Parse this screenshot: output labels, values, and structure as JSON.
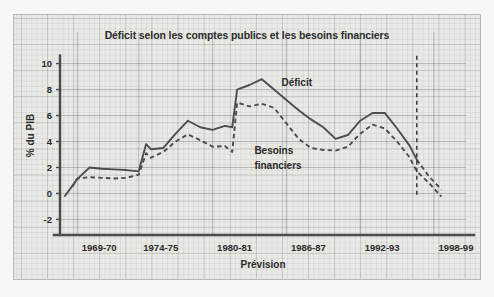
{
  "figure": {
    "background_color": "#f7f7f6",
    "panel_background_color": "#e9e9e6",
    "panel_border_color": "#b9b9b6",
    "line_color": "#4d4d4d"
  },
  "chart_data": {
    "type": "line",
    "title": "Déficit selon les comptes publics et les besoins financiers",
    "xlabel": "Prévision",
    "ylabel": "% du PIB",
    "ylim": [
      -3.2,
      11.2
    ],
    "yticks": [
      10,
      8,
      6,
      4,
      2,
      0,
      -2
    ],
    "ytick_labels": [
      "10",
      "8",
      "6",
      "4",
      "2",
      "0",
      "-2"
    ],
    "xtick_labels": [
      "1969-70",
      "1974-75",
      "1980-81",
      "1986-87",
      "1992-93",
      "1998-99"
    ],
    "xtick_values": [
      1969,
      1974,
      1980,
      1986,
      1992,
      1998
    ],
    "xlim": [
      1967.6,
      2000.6
    ],
    "grid": true,
    "legend": "inline-annotations",
    "annotations": [
      {
        "text": "Déficit",
        "x": 1985.6,
        "y": 8.3
      },
      {
        "text": "Besoins",
        "x": 1983.4,
        "y": 3.05
      },
      {
        "text": "financiers",
        "x": 1983.4,
        "y": 1.85
      }
    ],
    "forecast_marker": {
      "label": "Prévision",
      "x": 1996.6,
      "y_top": 10.6,
      "y_bottom": -0.1,
      "style": "dashed-vertical"
    },
    "series": [
      {
        "name": "Déficit",
        "style": "solid",
        "dashed_after_x": 1996.6,
        "x": [
          1968.0,
          1969.0,
          1970.0,
          1971.0,
          1972.0,
          1973.0,
          1974.0,
          1974.6,
          1975.0,
          1976.0,
          1977.0,
          1978.0,
          1979.0,
          1980.0,
          1981.0,
          1981.6,
          1982.0,
          1983.0,
          1984.0,
          1985.0,
          1986.0,
          1987.0,
          1988.0,
          1989.0,
          1990.0,
          1991.0,
          1992.0,
          1993.0,
          1994.0,
          1995.0,
          1996.0,
          1996.6,
          1997.6,
          1998.6
        ],
        "y": [
          -0.2,
          1.1,
          2.0,
          1.9,
          1.85,
          1.8,
          1.7,
          3.8,
          3.4,
          3.5,
          4.6,
          5.6,
          5.1,
          4.9,
          5.2,
          5.1,
          8.0,
          8.35,
          8.8,
          8.0,
          7.2,
          6.4,
          5.7,
          5.1,
          4.2,
          4.5,
          5.6,
          6.2,
          6.2,
          5.0,
          3.7,
          2.6,
          1.3,
          0.3
        ]
      },
      {
        "name": "Besoins financiers",
        "style": "dashed",
        "x": [
          1968.6,
          1969.0,
          1970.0,
          1971.0,
          1972.0,
          1973.0,
          1974.0,
          1974.6,
          1975.0,
          1976.0,
          1977.0,
          1978.0,
          1979.0,
          1980.0,
          1981.0,
          1981.6,
          1982.0,
          1983.0,
          1984.0,
          1985.0,
          1986.0,
          1987.0,
          1988.0,
          1989.0,
          1990.0,
          1991.0,
          1992.0,
          1993.0,
          1994.0,
          1995.0,
          1996.0,
          1996.6,
          1997.6,
          1998.6
        ],
        "y": [
          0.5,
          1.15,
          1.25,
          1.2,
          1.15,
          1.2,
          1.45,
          3.1,
          2.75,
          3.2,
          4.0,
          4.55,
          4.1,
          3.6,
          3.65,
          3.2,
          7.0,
          6.7,
          6.9,
          6.6,
          5.4,
          4.2,
          3.5,
          3.35,
          3.3,
          3.6,
          4.6,
          5.3,
          5.0,
          4.0,
          2.8,
          1.7,
          0.8,
          -0.25
        ]
      }
    ]
  }
}
